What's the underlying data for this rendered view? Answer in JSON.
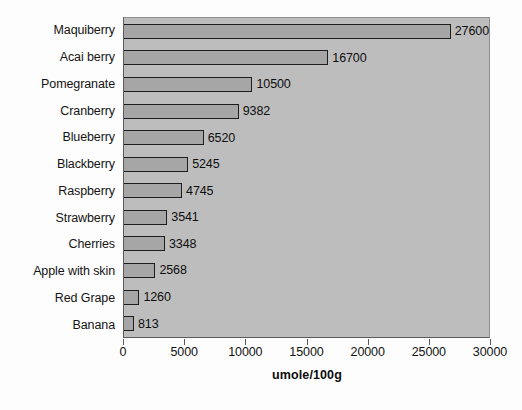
{
  "chart_data": {
    "type": "bar",
    "orientation": "horizontal",
    "title": "",
    "xlabel": "umole/100g",
    "ylabel": "",
    "xlim": [
      0,
      30000
    ],
    "xticks": [
      0,
      5000,
      10000,
      15000,
      20000,
      25000,
      30000
    ],
    "xtick_labels": [
      "0",
      "5000",
      "10000",
      "15000",
      "20000",
      "25000",
      "30000"
    ],
    "grid": false,
    "legend": null,
    "categories": [
      "Maquiberry",
      "Acai berry",
      "Pomegranate",
      "Cranberry",
      "Blueberry",
      "Blackberry",
      "Raspberry",
      "Strawberry",
      "Cherries",
      "Apple with skin",
      "Red Grape",
      "Banana"
    ],
    "values": [
      27600,
      16700,
      10500,
      9382,
      6520,
      5245,
      4745,
      3541,
      3348,
      2568,
      1260,
      813
    ],
    "value_labels": [
      "27600",
      "16700",
      "10500",
      "9382",
      "6520",
      "5245",
      "4745",
      "3541",
      "3348",
      "2568",
      "1260",
      "813"
    ],
    "colors": {
      "bar_fill": "#a6a6a6",
      "bar_border": "#1d1d1d",
      "plot_background": "#bdbdbd",
      "figure_background": "#fdfdfd",
      "text": "#121212",
      "axis_line": "#5a5a5a"
    }
  }
}
